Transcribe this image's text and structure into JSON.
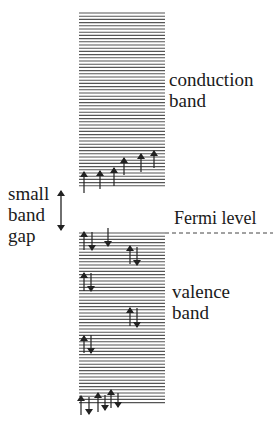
{
  "labels": {
    "conduction": [
      "conduction",
      "band"
    ],
    "valence": [
      "valence",
      "band"
    ],
    "gap": [
      "small",
      "band",
      "gap"
    ],
    "fermi": "Fermi level"
  },
  "colors": {
    "line": "#555555",
    "arrow": "#222222",
    "text": "#1a1a1a",
    "background": "#ffffff"
  },
  "geometry": {
    "band_x": [
      79,
      165
    ],
    "conduction_band_y": [
      13,
      186
    ],
    "valence_band_y": [
      233,
      405
    ],
    "line_spacing": 3.2,
    "fermi_level": {
      "y": 233,
      "x": [
        165,
        273
      ]
    },
    "gap_arrow": {
      "x": 61,
      "y": [
        191,
        230
      ]
    }
  },
  "electrons": {
    "conduction": [
      {
        "x": 84,
        "y1": 193,
        "y2": 172,
        "dir": "up"
      },
      {
        "x": 100,
        "y1": 189,
        "y2": 171,
        "dir": "up"
      },
      {
        "x": 114,
        "y1": 186,
        "y2": 168,
        "dir": "up"
      },
      {
        "x": 124,
        "y1": 175,
        "y2": 158,
        "dir": "up"
      },
      {
        "x": 141,
        "y1": 172,
        "y2": 154,
        "dir": "up"
      },
      {
        "x": 154,
        "y1": 168,
        "y2": 151,
        "dir": "up"
      }
    ],
    "valence": [
      {
        "x": 84,
        "y1": 250,
        "y2": 232,
        "dir": "up"
      },
      {
        "x": 92,
        "y1": 232,
        "y2": 250,
        "dir": "down"
      },
      {
        "x": 108,
        "y1": 228,
        "y2": 246,
        "dir": "down"
      },
      {
        "x": 130,
        "y1": 264,
        "y2": 246,
        "dir": "up"
      },
      {
        "x": 137,
        "y1": 247,
        "y2": 265,
        "dir": "down"
      },
      {
        "x": 84,
        "y1": 291,
        "y2": 273,
        "dir": "up"
      },
      {
        "x": 91,
        "y1": 273,
        "y2": 291,
        "dir": "down"
      },
      {
        "x": 130,
        "y1": 326,
        "y2": 308,
        "dir": "up"
      },
      {
        "x": 137,
        "y1": 308,
        "y2": 327,
        "dir": "down"
      },
      {
        "x": 84,
        "y1": 353,
        "y2": 336,
        "dir": "up"
      },
      {
        "x": 91,
        "y1": 335,
        "y2": 353,
        "dir": "down"
      },
      {
        "x": 81,
        "y1": 415,
        "y2": 396,
        "dir": "up"
      },
      {
        "x": 89,
        "y1": 397,
        "y2": 414,
        "dir": "down"
      },
      {
        "x": 98,
        "y1": 412,
        "y2": 393,
        "dir": "up"
      },
      {
        "x": 105,
        "y1": 395,
        "y2": 410,
        "dir": "down"
      },
      {
        "x": 111,
        "y1": 408,
        "y2": 390,
        "dir": "up"
      },
      {
        "x": 118,
        "y1": 393,
        "y2": 407,
        "dir": "down"
      }
    ]
  }
}
